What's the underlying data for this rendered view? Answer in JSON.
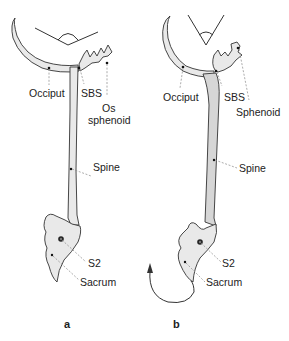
{
  "figure": {
    "panels": [
      {
        "id": "a",
        "label": "a",
        "labels": {
          "occiput": "Occiput",
          "sbs": "SBS",
          "sphenoid_line1": "Os",
          "sphenoid_line2": "sphenoid",
          "spine": "Spine",
          "s2": "S2",
          "sacrum": "Sacrum"
        }
      },
      {
        "id": "b",
        "label": "b",
        "labels": {
          "occiput": "Occiput",
          "sbs": "SBS",
          "sphenoid": "Sphenoid",
          "spine": "Spine",
          "s2": "S2",
          "sacrum": "Sacrum"
        },
        "arrow": "rotation-arrow"
      }
    ]
  }
}
